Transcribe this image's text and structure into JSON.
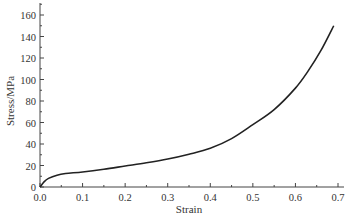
{
  "chart_data": {
    "type": "line",
    "title": "",
    "xlabel": "Strain",
    "ylabel": "Stress/MPa",
    "xlim": [
      0.0,
      0.7
    ],
    "ylim": [
      0,
      170
    ],
    "xticks": [
      "0.0",
      "0.1",
      "0.2",
      "0.3",
      "0.4",
      "0.5",
      "0.6",
      "0.7"
    ],
    "yticks": [
      "0",
      "20",
      "40",
      "60",
      "80",
      "100",
      "120",
      "140",
      "160"
    ],
    "grid": false,
    "legend": null,
    "series": [
      {
        "name": "stress-strain",
        "x": [
          0.0,
          0.01,
          0.02,
          0.04,
          0.06,
          0.1,
          0.15,
          0.2,
          0.25,
          0.3,
          0.35,
          0.4,
          0.45,
          0.5,
          0.55,
          0.6,
          0.63,
          0.66,
          0.69
        ],
        "y": [
          0,
          5,
          8,
          11,
          12.5,
          14,
          16.5,
          19.5,
          22.5,
          26,
          30.5,
          36,
          45,
          58,
          72,
          92,
          108,
          127,
          150
        ]
      }
    ]
  }
}
